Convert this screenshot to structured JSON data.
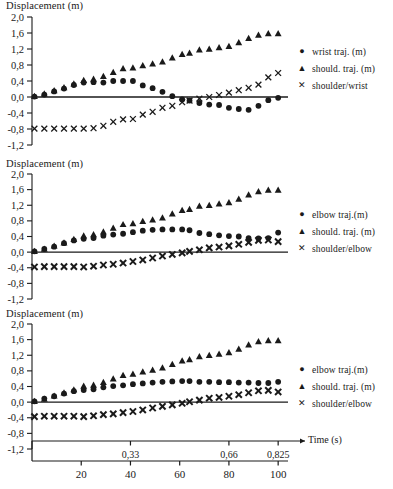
{
  "figure": {
    "y_axis_title": "Displacement (m)",
    "x_axis_title": "Time (s)",
    "y_ticks": [
      "2,0",
      "1,6",
      "1,2",
      "0,8",
      "0,4",
      "0,0",
      "-0,4",
      "-0,8",
      "-1,2"
    ],
    "time_ticks": [
      "0,33",
      "0,66",
      "0,825"
    ],
    "frame_ticks": [
      "20",
      "40",
      "60",
      "80",
      "100"
    ],
    "marker_circle": "●",
    "marker_triangle": "▲",
    "marker_cross": "✕",
    "ink_color": "#1a1a1a"
  },
  "chart_data": [
    {
      "type": "scatter",
      "title": "",
      "ylabel": "Displacement (m)",
      "xlabel": "Time (s)",
      "ylim": [
        -1.2,
        2.0
      ],
      "yticks": [
        2.0,
        1.6,
        1.2,
        0.8,
        0.4,
        0.0,
        -0.4,
        -0.8,
        -1.2
      ],
      "xlim": [
        0,
        104
      ],
      "xticks_time": [
        0.33,
        0.66,
        0.825
      ],
      "xticks_frame": [
        20,
        40,
        60,
        80,
        100
      ],
      "grid": false,
      "legend_position": "right",
      "x": [
        1,
        5,
        9,
        13,
        17,
        21,
        25,
        29,
        33,
        37,
        41,
        45,
        49,
        53,
        57,
        61,
        64,
        68,
        72,
        76,
        80,
        84,
        88,
        92,
        96,
        100
      ],
      "series": [
        {
          "name": "wrist traj. (m)",
          "marker": "circle",
          "values": [
            0.01,
            0.06,
            0.14,
            0.21,
            0.3,
            0.36,
            0.37,
            0.36,
            0.4,
            0.4,
            0.4,
            0.29,
            0.22,
            0.13,
            0.02,
            -0.06,
            -0.09,
            -0.15,
            -0.19,
            -0.2,
            -0.27,
            -0.3,
            -0.32,
            -0.22,
            -0.08,
            -0.02
          ]
        },
        {
          "name": "should. traj. (m)",
          "marker": "triangle",
          "values": [
            0.02,
            0.08,
            0.16,
            0.24,
            0.33,
            0.42,
            0.45,
            0.52,
            0.62,
            0.71,
            0.73,
            0.79,
            0.83,
            0.88,
            0.98,
            1.07,
            1.1,
            1.18,
            1.2,
            1.24,
            1.27,
            1.36,
            1.47,
            1.55,
            1.59,
            1.59
          ]
        },
        {
          "name": "shoulder/wrist",
          "marker": "cross",
          "values": [
            -0.79,
            -0.79,
            -0.79,
            -0.79,
            -0.79,
            -0.79,
            -0.78,
            -0.72,
            -0.62,
            -0.56,
            -0.55,
            -0.44,
            -0.37,
            -0.27,
            -0.22,
            -0.13,
            -0.09,
            -0.04,
            0.0,
            0.05,
            0.11,
            0.17,
            0.23,
            0.31,
            0.49,
            0.6
          ]
        }
      ]
    },
    {
      "type": "scatter",
      "title": "",
      "ylabel": "Displacement (m)",
      "xlabel": "Time (s)",
      "ylim": [
        -1.2,
        2.0
      ],
      "yticks": [
        2.0,
        1.6,
        1.2,
        0.8,
        0.4,
        0.0,
        -0.4,
        -0.8,
        -1.2
      ],
      "xlim": [
        0,
        104
      ],
      "xticks_time": [
        0.33,
        0.66,
        0.825
      ],
      "xticks_frame": [
        20,
        40,
        60,
        80,
        100
      ],
      "grid": false,
      "legend_position": "right",
      "x": [
        1,
        5,
        9,
        13,
        17,
        21,
        25,
        29,
        33,
        37,
        41,
        45,
        49,
        53,
        57,
        61,
        64,
        68,
        72,
        76,
        80,
        84,
        88,
        92,
        96,
        100
      ],
      "series": [
        {
          "name": "elbow traj.(m)",
          "marker": "circle",
          "values": [
            0.02,
            0.08,
            0.14,
            0.23,
            0.3,
            0.34,
            0.36,
            0.42,
            0.45,
            0.47,
            0.51,
            0.55,
            0.57,
            0.58,
            0.58,
            0.58,
            0.56,
            0.49,
            0.46,
            0.43,
            0.41,
            0.4,
            0.36,
            0.35,
            0.36,
            0.5
          ]
        },
        {
          "name": "should. traj. (m)",
          "marker": "triangle",
          "values": [
            0.02,
            0.08,
            0.16,
            0.24,
            0.33,
            0.42,
            0.45,
            0.52,
            0.62,
            0.71,
            0.73,
            0.79,
            0.83,
            0.88,
            0.98,
            1.07,
            1.1,
            1.18,
            1.2,
            1.24,
            1.27,
            1.36,
            1.47,
            1.55,
            1.59,
            1.59
          ]
        },
        {
          "name": "shoulder/elbow",
          "marker": "cross",
          "values": [
            -0.38,
            -0.37,
            -0.37,
            -0.37,
            -0.37,
            -0.38,
            -0.36,
            -0.33,
            -0.31,
            -0.28,
            -0.24,
            -0.2,
            -0.15,
            -0.1,
            -0.06,
            -0.02,
            0.02,
            0.06,
            0.11,
            0.13,
            0.16,
            0.2,
            0.25,
            0.3,
            0.31,
            0.27
          ]
        }
      ]
    },
    {
      "type": "scatter",
      "title": "",
      "ylabel": "Displacement (m)",
      "xlabel": "Time (s)",
      "ylim": [
        -1.2,
        2.0
      ],
      "yticks": [
        2.0,
        1.6,
        1.2,
        0.8,
        0.4,
        0.0,
        -0.4,
        -0.8,
        -1.2
      ],
      "xlim": [
        0,
        104
      ],
      "xticks_time": [
        0.33,
        0.66,
        0.825
      ],
      "xticks_frame": [
        20,
        40,
        60,
        80,
        100
      ],
      "grid": false,
      "legend_position": "right",
      "x": [
        1,
        5,
        9,
        13,
        17,
        21,
        25,
        29,
        33,
        37,
        41,
        45,
        49,
        53,
        57,
        61,
        64,
        68,
        72,
        76,
        80,
        84,
        88,
        92,
        96,
        100
      ],
      "series": [
        {
          "name": "elbow traj.(m)",
          "marker": "circle",
          "values": [
            0.02,
            0.09,
            0.15,
            0.22,
            0.28,
            0.31,
            0.33,
            0.38,
            0.41,
            0.43,
            0.46,
            0.48,
            0.5,
            0.52,
            0.53,
            0.54,
            0.54,
            0.52,
            0.52,
            0.51,
            0.51,
            0.5,
            0.5,
            0.49,
            0.49,
            0.52
          ]
        },
        {
          "name": "should. traj. (m)",
          "marker": "triangle",
          "values": [
            0.02,
            0.08,
            0.16,
            0.24,
            0.32,
            0.41,
            0.44,
            0.51,
            0.6,
            0.69,
            0.72,
            0.78,
            0.82,
            0.88,
            0.97,
            1.06,
            1.09,
            1.17,
            1.2,
            1.23,
            1.27,
            1.36,
            1.47,
            1.55,
            1.58,
            1.58
          ]
        },
        {
          "name": "shoulder/elbow",
          "marker": "cross",
          "values": [
            -0.37,
            -0.36,
            -0.36,
            -0.36,
            -0.36,
            -0.37,
            -0.35,
            -0.32,
            -0.3,
            -0.27,
            -0.24,
            -0.2,
            -0.15,
            -0.11,
            -0.07,
            -0.03,
            0.01,
            0.05,
            0.1,
            0.12,
            0.15,
            0.19,
            0.24,
            0.29,
            0.3,
            0.26
          ]
        }
      ]
    }
  ],
  "legends": [
    {
      "items": [
        {
          "marker": "●",
          "label": "wrist traj. (m)"
        },
        {
          "marker": "▲",
          "label": "should. traj. (m)"
        },
        {
          "marker": "✕",
          "label": "shoulder/wrist"
        }
      ]
    },
    {
      "items": [
        {
          "marker": "●",
          "label": "elbow traj.(m)"
        },
        {
          "marker": "▲",
          "label": "should. traj. (m)"
        },
        {
          "marker": "✕",
          "label": "shoulder/elbow"
        }
      ]
    },
    {
      "items": [
        {
          "marker": "●",
          "label": "elbow traj.(m)"
        },
        {
          "marker": "▲",
          "label": "should. traj. (m)"
        },
        {
          "marker": "✕",
          "label": "shoulder/elbow"
        }
      ]
    }
  ]
}
